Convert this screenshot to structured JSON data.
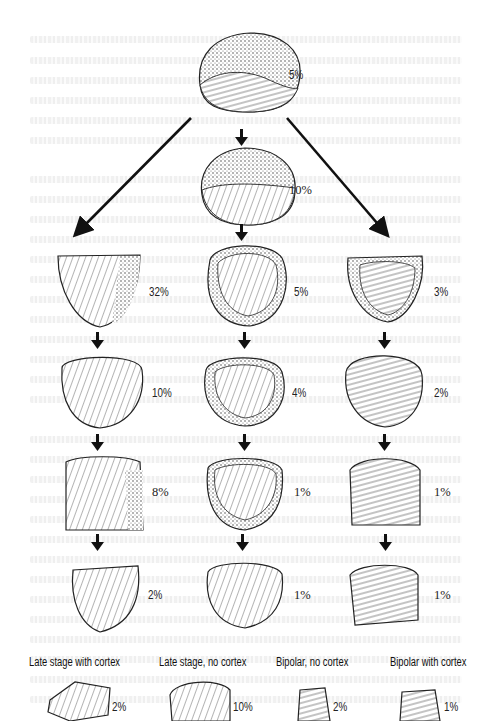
{
  "figure": {
    "type": "lithic core reduction sequence",
    "top_core": {
      "label": "5%"
    },
    "second_core": {
      "label": "10%"
    },
    "columns": [
      {
        "name": "left",
        "stages": [
          "32%",
          "10%",
          "8%",
          "2%"
        ]
      },
      {
        "name": "center",
        "stages": [
          "5%",
          "4%",
          "1%",
          "1%"
        ]
      },
      {
        "name": "right",
        "stages": [
          "3%",
          "2%",
          "1%",
          "1%"
        ]
      }
    ],
    "bottom_row": [
      {
        "title": "Late stage with cortex",
        "pct": "2%"
      },
      {
        "title": "Late stage, no cortex",
        "pct": "10%"
      },
      {
        "title": "Bipolar, no cortex",
        "pct": "2%"
      },
      {
        "title": "Bipolar with cortex",
        "pct": "1%"
      }
    ]
  },
  "colors": {
    "ink": "#1a1a1a",
    "paper": "#ffffff",
    "bleed_text": "#e6e6e6"
  }
}
